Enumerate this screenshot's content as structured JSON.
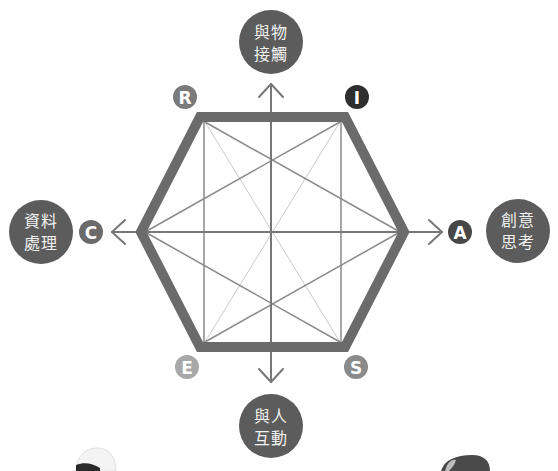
{
  "diagram": {
    "type": "RIASEC hexagon",
    "letters": {
      "R": {
        "text": "R",
        "color": "#7b7b7b"
      },
      "I": {
        "text": "I",
        "color": "#2e2e2e"
      },
      "A": {
        "text": "A",
        "color": "#474747"
      },
      "S": {
        "text": "S",
        "color": "#8a8a8a"
      },
      "E": {
        "text": "E",
        "color": "#a8a8a8"
      },
      "C": {
        "text": "C",
        "color": "#6a6a6a"
      }
    },
    "axes": {
      "top": {
        "line1": "與物",
        "line2": "接觸"
      },
      "bottom": {
        "line1": "與人",
        "line2": "互動"
      },
      "left": {
        "line1": "資料",
        "line2": "處理"
      },
      "right": {
        "line1": "創意",
        "line2": "思考"
      }
    }
  },
  "colors": {
    "hexagon_stroke": "#6b6b6b",
    "axis_circle": "#5c5c5c",
    "axis_line": "#777777",
    "inner_line": "#8a8a8a",
    "light_line": "#cacaca"
  }
}
